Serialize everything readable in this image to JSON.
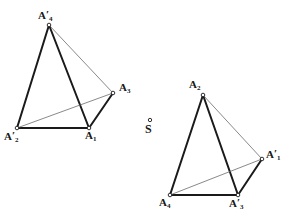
{
  "figure": {
    "canvas": {
      "width": 290,
      "height": 216,
      "background": "#ffffff"
    },
    "colors": {
      "edge_visible": "#1a1a1a",
      "edge_hidden": "#6b6b6b",
      "vertex_marker_stroke": "#1a1a1a",
      "vertex_marker_fill": "#ffffff",
      "label_text": "#171717"
    },
    "stroke_widths": {
      "visible": 2.0,
      "hidden": 0.8,
      "marker": 0.9
    },
    "solids": [
      {
        "name": "left-tetrahedron",
        "vertices": [
          {
            "id": "A4p",
            "label_base": "A",
            "prime": true,
            "subscript": "4",
            "x": 49,
            "y": 25,
            "label_x": 38,
            "label_y": 9,
            "marker": true
          },
          {
            "id": "A3",
            "label_base": "A",
            "prime": false,
            "subscript": "3",
            "x": 113,
            "y": 93,
            "label_x": 119,
            "label_y": 82,
            "marker": true
          },
          {
            "id": "A2p",
            "label_base": "A",
            "prime": true,
            "subscript": "2",
            "x": 17,
            "y": 128,
            "label_x": 4,
            "label_y": 130,
            "marker": true
          },
          {
            "id": "A1",
            "label_base": "A",
            "prime": false,
            "subscript": "1",
            "x": 89,
            "y": 128,
            "label_x": 85,
            "label_y": 130,
            "marker": true
          }
        ],
        "edges": [
          {
            "from": "A4p",
            "to": "A2p",
            "style": "visible"
          },
          {
            "from": "A4p",
            "to": "A1",
            "style": "visible"
          },
          {
            "from": "A2p",
            "to": "A1",
            "style": "visible"
          },
          {
            "from": "A1",
            "to": "A3",
            "style": "visible"
          },
          {
            "from": "A4p",
            "to": "A3",
            "style": "hidden"
          },
          {
            "from": "A2p",
            "to": "A3",
            "style": "hidden"
          }
        ]
      },
      {
        "name": "right-tetrahedron",
        "vertices": [
          {
            "id": "A2",
            "label_base": "A",
            "prime": false,
            "subscript": "2",
            "x": 203,
            "y": 95,
            "label_x": 189,
            "label_y": 79,
            "marker": true
          },
          {
            "id": "A1p",
            "label_base": "A",
            "prime": true,
            "subscript": "1",
            "x": 262,
            "y": 159,
            "label_x": 266,
            "label_y": 148,
            "marker": true
          },
          {
            "id": "A4",
            "label_base": "A",
            "prime": false,
            "subscript": "4",
            "x": 170,
            "y": 195,
            "label_x": 159,
            "label_y": 197,
            "marker": true
          },
          {
            "id": "A3p",
            "label_base": "A",
            "prime": true,
            "subscript": "3",
            "x": 238,
            "y": 195,
            "label_x": 229,
            "label_y": 197,
            "marker": true
          }
        ],
        "edges": [
          {
            "from": "A2",
            "to": "A4",
            "style": "visible"
          },
          {
            "from": "A2",
            "to": "A3p",
            "style": "visible"
          },
          {
            "from": "A4",
            "to": "A3p",
            "style": "visible"
          },
          {
            "from": "A3p",
            "to": "A1p",
            "style": "visible"
          },
          {
            "from": "A2",
            "to": "A1p",
            "style": "hidden"
          },
          {
            "from": "A4",
            "to": "A1p",
            "style": "hidden"
          }
        ]
      }
    ],
    "points": [
      {
        "id": "S",
        "label": "S",
        "x": 150,
        "y": 120,
        "label_x": 145,
        "label_y": 123,
        "marker": true
      }
    ]
  }
}
